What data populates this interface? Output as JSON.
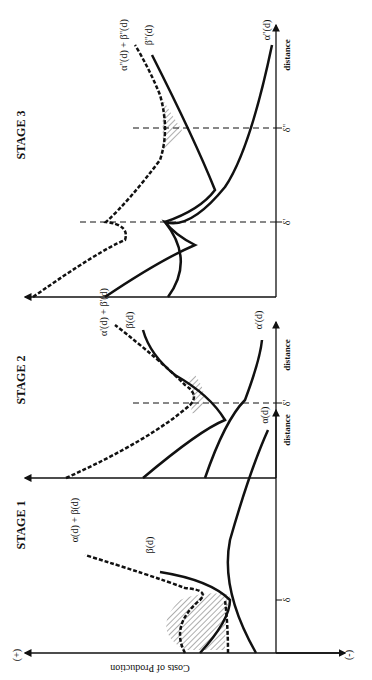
{
  "figure": {
    "orientation": "rotated-90-ccw",
    "y_axis_label": "Costs of Production",
    "y_axis_plus": "(+)",
    "y_axis_minus": "(-)",
    "x_axis_label": "distance",
    "stages": [
      {
        "title": "STAGE 1",
        "curves": [
          "α(d) + β(d)",
          "β(d)",
          "α(d)"
        ],
        "marker": "δ"
      },
      {
        "title": "STAGE 2",
        "curves": [
          "α'(d) + β'(d)",
          "β(d)",
          "α'(d)"
        ],
        "marker": "δ'"
      },
      {
        "title": "STAGE 3",
        "curves": [
          "α''(d) + β''(d)",
          "β''(d)",
          "α''(d)"
        ],
        "markers": [
          "δ'",
          "δ''"
        ]
      }
    ]
  }
}
